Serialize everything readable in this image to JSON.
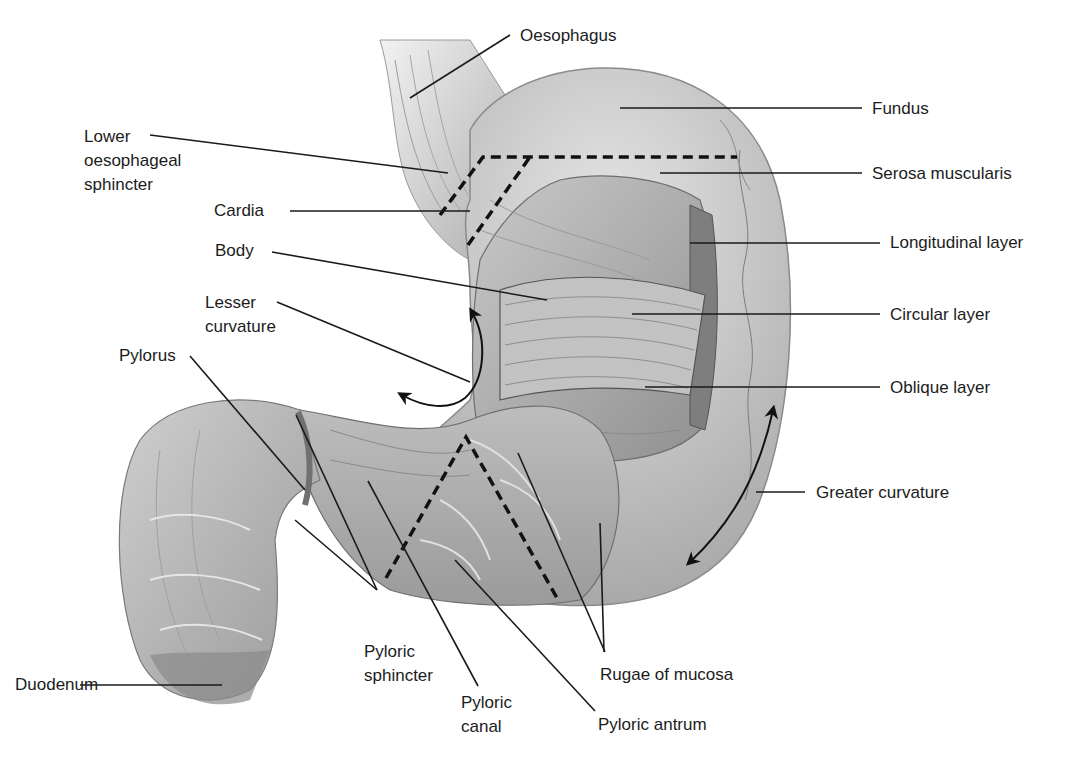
{
  "diagram": {
    "title": "",
    "labels": {
      "oesophagus": "Oesophagus",
      "fundus": "Fundus",
      "lower_oesophageal_sphincter": "Lower\noesophageal\nsphincter",
      "serosa_muscularis": "Serosa muscularis",
      "cardia": "Cardia",
      "longitudinal_layer": "Longitudinal layer",
      "body": "Body",
      "circular_layer": "Circular layer",
      "lesser_curvature": "Lesser\ncurvature",
      "oblique_layer": "Oblique layer",
      "pylorus": "Pylorus",
      "greater_curvature": "Greater curvature",
      "duodenum": "Duodenum",
      "pyloric_sphincter": "Pyloric\nsphincter",
      "pyloric_canal": "Pyloric\ncanal",
      "rugae_of_mucosa": "Rugae of mucosa",
      "pyloric_antrum": "Pyloric antrum"
    },
    "colors": {
      "background": "#ffffff",
      "tissue_light": "#d9d9d9",
      "tissue_mid": "#b3b3b3",
      "tissue_dark": "#8a8a8a",
      "leader_line": "#1a1a1a"
    }
  }
}
